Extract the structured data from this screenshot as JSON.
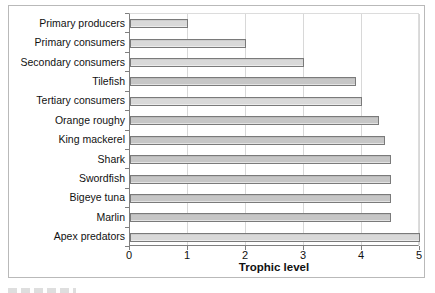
{
  "chart_data": {
    "type": "bar",
    "orientation": "horizontal",
    "title": "",
    "xlabel": "Trophic level",
    "ylabel": "",
    "categories": [
      "Primary producers",
      "Primary consumers",
      "Secondary consumers",
      "Tilefish",
      "Tertiary consumers",
      "Orange roughy",
      "King mackerel",
      "Shark",
      "Swordfish",
      "Bigeye tuna",
      "Marlin",
      "Apex predators"
    ],
    "values": [
      1.0,
      2.0,
      3.0,
      3.9,
      4.0,
      4.3,
      4.4,
      4.5,
      4.5,
      4.5,
      4.5,
      5.0
    ],
    "bar_shades": [
      "light",
      "light",
      "light",
      "dark",
      "light",
      "dark",
      "dark",
      "dark",
      "dark",
      "dark",
      "dark",
      "light"
    ],
    "xlim": [
      0,
      5
    ],
    "xticks": [
      0,
      1,
      2,
      3,
      4,
      5
    ],
    "grid": "vertical",
    "legend": "none",
    "colors": {
      "bar_fill_light": "#d9d9d9",
      "bar_fill_dark": "#c6c6c6",
      "bar_border": "#7a7a7a",
      "gridline": "#d8d8d8",
      "axis_line": "#7f7f7f",
      "text": "#111111",
      "figure_border": "#b9b9b9",
      "background": "#ffffff"
    }
  }
}
